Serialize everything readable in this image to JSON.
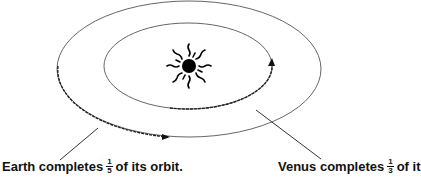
{
  "diagram": {
    "sun": {
      "icon": "sun-icon"
    },
    "orbits": [
      {
        "name": "Earth orbit",
        "fraction_completed": "1/5"
      },
      {
        "name": "Venus orbit",
        "fraction_completed": "1/3"
      }
    ],
    "labels": {
      "earth": {
        "prefix": "Earth completes",
        "numerator": "1",
        "denominator": "5",
        "suffix": "of its orbit."
      },
      "venus": {
        "prefix": "Venus completes",
        "numerator": "1",
        "denominator": "3",
        "suffix": "of it"
      }
    },
    "colors": {
      "line": "#555555",
      "path": "#222222",
      "text": "#111111"
    }
  }
}
